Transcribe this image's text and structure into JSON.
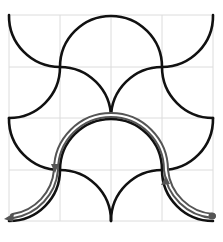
{
  "figure": {
    "grid": {
      "rows": 4,
      "cols": 4,
      "color": "#d9d9d9"
    },
    "curve_color": "#111111",
    "path_color": "#555555",
    "path": {
      "start": "bottom-right corner (dot)",
      "end": "bottom-left corner (arrowhead)",
      "direction_markers": [
        "up-arrow at right junction",
        "down-arrow at left junction"
      ]
    }
  }
}
